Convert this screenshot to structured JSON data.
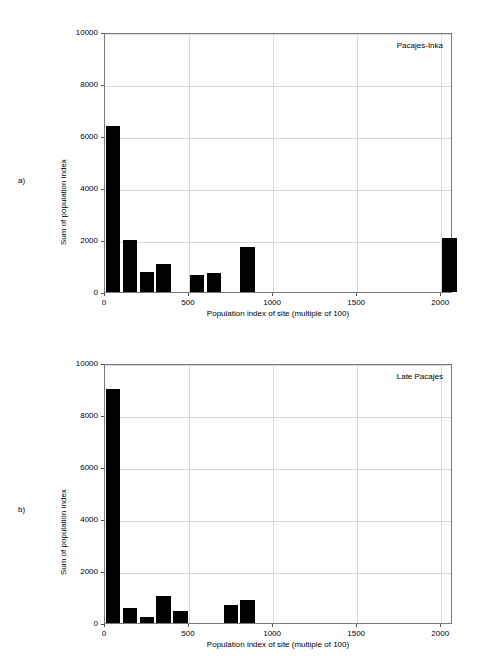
{
  "panels": [
    {
      "letter": "a)",
      "annotation": "Pacajes-Inka",
      "xlabel": "Population index of site (multiple of 100)",
      "ylabel": "Sum of population index",
      "yticks": [
        "0",
        "2000",
        "4000",
        "6000",
        "8000",
        "10000"
      ],
      "xticks": [
        "0",
        "500",
        "1000",
        "1500",
        "2000"
      ]
    },
    {
      "letter": "b)",
      "annotation": "Late Pacajes",
      "xlabel": "Population index of site (multiple of 100)",
      "ylabel": "Sum of population index",
      "yticks": [
        "0",
        "2000",
        "4000",
        "6000",
        "8000",
        "10000"
      ],
      "xticks": [
        "0",
        "500",
        "1000",
        "1500",
        "2000"
      ]
    }
  ],
  "chart_data": [
    {
      "type": "bar",
      "panel": "a",
      "title": "Pacajes-Inka",
      "xlabel": "Population index of site (multiple of 100)",
      "ylabel": "Sum of population index",
      "xlim": [
        0,
        2070
      ],
      "ylim": [
        0,
        10000
      ],
      "ytick_values": [
        0,
        2000,
        4000,
        6000,
        8000,
        10000
      ],
      "xtick_values": [
        0,
        500,
        1000,
        1500,
        2000
      ],
      "grid": true,
      "legend": "none",
      "bar_width": 85,
      "x": [
        0,
        100,
        200,
        300,
        500,
        600,
        800,
        2000
      ],
      "values": [
        6400,
        2000,
        775,
        1085,
        660,
        735,
        1745,
        2090
      ]
    },
    {
      "type": "bar",
      "panel": "b",
      "title": "Late Pacajes",
      "xlabel": "Population index of site (multiple of 100)",
      "ylabel": "Sum of population index",
      "xlim": [
        0,
        2070
      ],
      "ylim": [
        0,
        10000
      ],
      "ytick_values": [
        0,
        2000,
        4000,
        6000,
        8000,
        10000
      ],
      "xtick_values": [
        0,
        500,
        1000,
        1500,
        2000
      ],
      "grid": true,
      "legend": "none",
      "bar_width": 85,
      "x": [
        0,
        100,
        200,
        300,
        400,
        700,
        800
      ],
      "values": [
        9000,
        580,
        215,
        1050,
        470,
        690,
        880
      ]
    }
  ]
}
